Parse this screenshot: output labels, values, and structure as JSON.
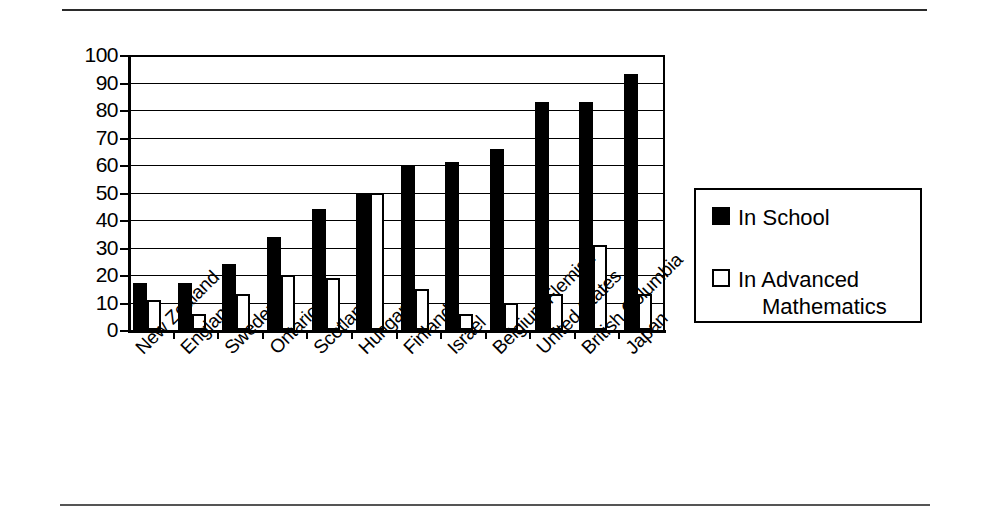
{
  "page": {
    "rule_top": "horizontal-rule",
    "rule_bottom": "horizontal-rule"
  },
  "chart_data": {
    "type": "bar",
    "title": "",
    "subtitle": "",
    "xlabel": "",
    "ylabel": "",
    "ylim": [
      0,
      100
    ],
    "ytick_step": 10,
    "grid": true,
    "legend_position": "right",
    "categories": [
      "New Zealand",
      "England",
      "Sweden",
      "Ontario",
      "Scotland",
      "Hungary",
      "Finland",
      "Israel",
      "Belgium Flemish",
      "United States",
      "British Columbia",
      "Japan"
    ],
    "ytick_labels": [
      "100",
      "90",
      "80",
      "70",
      "60",
      "50",
      "40",
      "30",
      "20",
      "10",
      "0"
    ],
    "series": [
      {
        "name": "In School",
        "fill": "#000000",
        "values": [
          17,
          17,
          24,
          34,
          44,
          50,
          60,
          61,
          66,
          83,
          83,
          93
        ]
      },
      {
        "name": "In Advanced Mathematics",
        "fill": "#ffffff",
        "values": [
          11,
          6,
          13,
          20,
          19,
          50,
          15,
          6,
          10,
          13,
          31,
          13
        ]
      }
    ]
  },
  "legend": {
    "items": [
      {
        "label": "In School",
        "label_line1": "In School",
        "label_line2": "",
        "swatch": "filled-square"
      },
      {
        "label": "In Advanced Mathematics",
        "label_line1": "In Advanced",
        "label_line2": "Mathematics",
        "swatch": "hollow-square"
      }
    ]
  },
  "colors": {
    "axis": "#000000",
    "grid": "#000000",
    "series_in_school": "#000000",
    "series_in_advanced_math": "#ffffff",
    "background": "#ffffff"
  }
}
